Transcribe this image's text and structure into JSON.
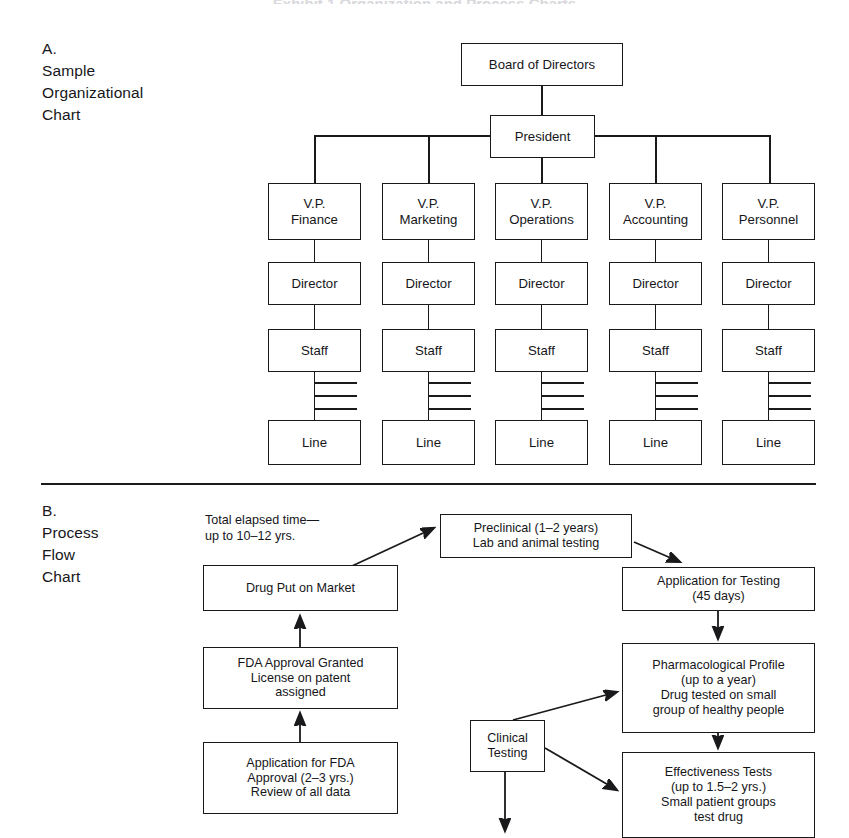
{
  "page": {
    "running_head": "Exhibit 1  Organization and Process Charts"
  },
  "section_a": {
    "caption": "A.\nSample\nOrganizational\nChart",
    "nodes": {
      "board": "Board of Directors",
      "president": "President",
      "vp_finance": [
        "V.P.",
        "Finance"
      ],
      "vp_marketing": [
        "V.P.",
        "Marketing"
      ],
      "vp_operations": [
        "V.P.",
        "Operations"
      ],
      "vp_accounting": [
        "V.P.",
        "Accounting"
      ],
      "vp_personnel": [
        "V.P.",
        "Personnel"
      ],
      "director": "Director",
      "staff": "Staff",
      "line": "Line"
    },
    "columns": [
      {
        "key": "finance",
        "vp_line1": "V.P.",
        "vp_line2": "Finance",
        "director": "Director",
        "staff": "Staff",
        "line": "Line"
      },
      {
        "key": "marketing",
        "vp_line1": "V.P.",
        "vp_line2": "Marketing",
        "director": "Director",
        "staff": "Staff",
        "line": "Line"
      },
      {
        "key": "operations",
        "vp_line1": "V.P.",
        "vp_line2": "Operations",
        "director": "Director",
        "staff": "Staff",
        "line": "Line"
      },
      {
        "key": "accounting",
        "vp_line1": "V.P.",
        "vp_line2": "Accounting",
        "director": "Director",
        "staff": "Staff",
        "line": "Line"
      },
      {
        "key": "personnel",
        "vp_line1": "V.P.",
        "vp_line2": "Personnel",
        "director": "Director",
        "staff": "Staff",
        "line": "Line"
      }
    ]
  },
  "section_b": {
    "caption": "B.\nProcess\nFlow\nChart",
    "annotation_total_time": "Total elapsed time—\nup to 10–12 yrs.",
    "nodes": {
      "drug_put_on_market": [
        "Drug Put on Market"
      ],
      "fda_approval_granted": [
        "FDA Approval Granted",
        "License on patent",
        "assigned"
      ],
      "application_for_fda_approval": [
        "Application for FDA",
        "Approval (2–3 yrs.)",
        "Review of all data"
      ],
      "preclinical": [
        "Preclinical (1–2 years)",
        "Lab and animal testing"
      ],
      "application_for_testing": [
        "Application for Testing",
        "(45 days)"
      ],
      "pharmacological_profile": [
        "Pharmacological Profile",
        "(up to a year)",
        "Drug tested on small",
        "group of healthy people"
      ],
      "effectiveness_tests": [
        "Effectiveness Tests",
        "(up to 1.5–2 yrs.)",
        "Small patient groups",
        "test drug"
      ],
      "clinical_testing": [
        "Clinical",
        "Testing"
      ]
    }
  },
  "chart_data": {
    "type": "diagram",
    "charts": [
      {
        "id": "organizational-chart",
        "label": "A. Sample Organizational Chart",
        "kind": "hierarchy",
        "levels": [
          "Board of Directors",
          "President",
          "V.P.",
          "Director",
          "Staff",
          "Line"
        ],
        "root": "Board of Directors",
        "edges": [
          [
            "Board of Directors",
            "President"
          ],
          [
            "President",
            "V.P. Finance"
          ],
          [
            "President",
            "V.P. Marketing"
          ],
          [
            "President",
            "V.P. Operations"
          ],
          [
            "President",
            "V.P. Accounting"
          ],
          [
            "President",
            "V.P. Personnel"
          ],
          [
            "V.P. Finance",
            "Director"
          ],
          [
            "V.P. Marketing",
            "Director"
          ],
          [
            "V.P. Operations",
            "Director"
          ],
          [
            "V.P. Accounting",
            "Director"
          ],
          [
            "V.P. Personnel",
            "Director"
          ],
          [
            "Director",
            "Staff"
          ],
          [
            "Staff",
            "Line"
          ]
        ]
      },
      {
        "id": "process-flow-chart",
        "label": "B. Process Flow Chart",
        "kind": "flow",
        "annotation": "Total elapsed time—up to 10–12 yrs.",
        "edges": [
          [
            "Preclinical (1–2 years) Lab and animal testing",
            "Application for Testing (45 days)"
          ],
          [
            "Application for Testing (45 days)",
            "Pharmacological Profile (up to a year)"
          ],
          [
            "Pharmacological Profile (up to a year)",
            "Effectiveness Tests (up to 1.5–2 yrs.)"
          ],
          [
            "Clinical Testing",
            "Pharmacological Profile (up to a year)"
          ],
          [
            "Clinical Testing",
            "Effectiveness Tests (up to 1.5–2 yrs.)"
          ],
          [
            "Application for FDA Approval (2–3 yrs.)",
            "FDA Approval Granted License on patent assigned"
          ],
          [
            "FDA Approval Granted License on patent assigned",
            "Drug Put on Market"
          ],
          [
            "Drug Put on Market",
            "Preclinical (1–2 years) Lab and animal testing"
          ]
        ]
      }
    ]
  }
}
